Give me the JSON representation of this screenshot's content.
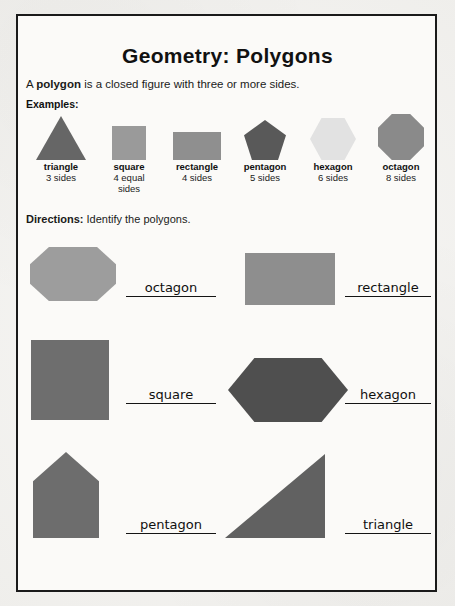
{
  "worksheet": {
    "title": "Geometry: Polygons",
    "definition_prefix": "A ",
    "definition_term": "polygon",
    "definition_suffix": " is a closed figure with three or more sides.",
    "examples_label": "Examples:",
    "directions_label": "Directions:",
    "directions_text": " Identify the polygons."
  },
  "examples": [
    {
      "name": "triangle",
      "sides": "3 sides",
      "sides_extra": "",
      "shape": "triangle-icon",
      "color": "#666666"
    },
    {
      "name": "square",
      "sides": "4 equal",
      "sides_extra": "sides",
      "shape": "square-icon",
      "color": "#9a9a9a"
    },
    {
      "name": "rectangle",
      "sides": "4 sides",
      "sides_extra": "",
      "shape": "rectangle-icon",
      "color": "#8f8f8f"
    },
    {
      "name": "pentagon",
      "sides": "5 sides",
      "sides_extra": "",
      "shape": "pentagon-icon",
      "color": "#595959"
    },
    {
      "name": "hexagon",
      "sides": "6 sides",
      "sides_extra": "",
      "shape": "hexagon-icon",
      "color": "#e2e2e2"
    },
    {
      "name": "octagon",
      "sides": "8 sides",
      "sides_extra": "",
      "shape": "octagon-icon",
      "color": "#8a8a8a"
    }
  ],
  "exercises": [
    {
      "shape": "octagon-shape",
      "answer": "octagon",
      "color": "#9d9d9d"
    },
    {
      "shape": "rectangle-shape",
      "answer": "rectangle",
      "color": "#8e8e8e"
    },
    {
      "shape": "square-shape",
      "answer": "square",
      "color": "#6e6e6e"
    },
    {
      "shape": "hexagon-shape",
      "answer": "hexagon",
      "color": "#4f4f4f"
    },
    {
      "shape": "pentagon-shape",
      "answer": "pentagon",
      "color": "#6d6d6d"
    },
    {
      "shape": "triangle-shape",
      "answer": "triangle",
      "color": "#616161"
    }
  ]
}
